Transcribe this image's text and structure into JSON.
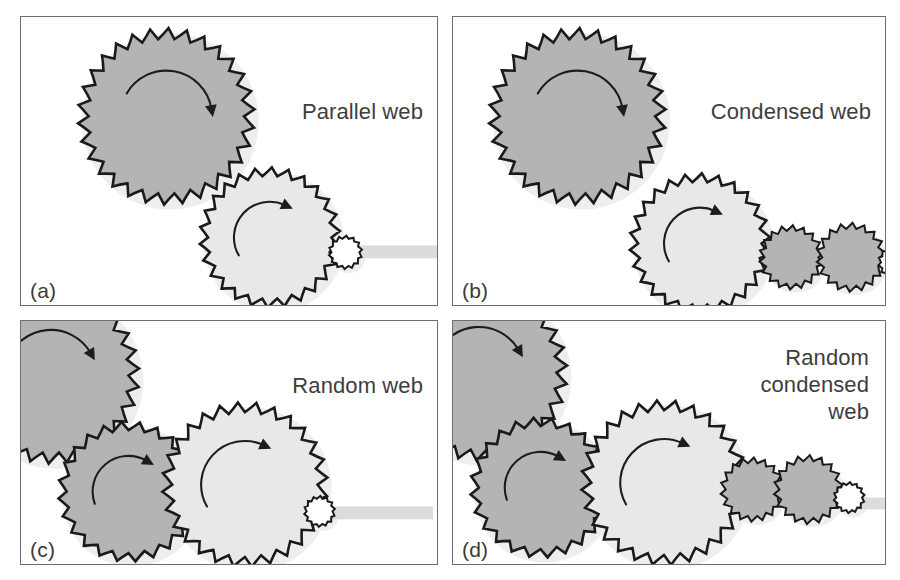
{
  "figure": {
    "type": "diagram",
    "background": "#ffffff"
  },
  "colors": {
    "panel_border": "#6e6e6e",
    "gear_dark_fill": "#b4b4b4",
    "gear_light_fill": "#e8e8e8",
    "gear_white_fill": "#ffffff",
    "gear_outline": "#1a1a1a",
    "glow": "#ededed",
    "shaft_bar": "#dcdcdc",
    "text": "#3d3d3d"
  },
  "panels": [
    {
      "id": "a",
      "label": "(a)",
      "caption": "Parallel web",
      "caption_lines": [
        "Parallel web"
      ],
      "x": 20,
      "y": 16,
      "w": 418,
      "h": 290,
      "gears": [
        {
          "name": "driver-gear",
          "cx": 146,
          "cy": 100,
          "r": 78,
          "teeth": 30,
          "fill": "dark",
          "arrow": "cw",
          "arrow_r": 46,
          "arrow_from": -150,
          "arrow_to": -10
        },
        {
          "name": "driven-gear",
          "cx": 250,
          "cy": 222,
          "r": 62,
          "teeth": 26,
          "fill": "light",
          "arrow": "cw",
          "arrow_r": 36,
          "arrow_from": 150,
          "arrow_to": 295
        },
        {
          "name": "output-pinion",
          "cx": 326,
          "cy": 237,
          "r": 14,
          "teeth": 14,
          "fill": "white",
          "arrow": "none"
        }
      ],
      "shaft_bar": {
        "x": 330,
        "y": 230,
        "w": 90,
        "h": 13
      }
    },
    {
      "id": "b",
      "label": "(b)",
      "caption": "Condensed web",
      "caption_lines": [
        "Condensed web"
      ],
      "x": 452,
      "y": 16,
      "w": 434,
      "h": 290,
      "gears": [
        {
          "name": "driver-gear",
          "cx": 125,
          "cy": 100,
          "r": 78,
          "teeth": 30,
          "fill": "dark",
          "arrow": "cw",
          "arrow_r": 46,
          "arrow_from": -150,
          "arrow_to": -10
        },
        {
          "name": "driven-gear",
          "cx": 248,
          "cy": 228,
          "r": 62,
          "teeth": 26,
          "fill": "light",
          "arrow": "cw",
          "arrow_r": 36,
          "arrow_from": 150,
          "arrow_to": 295
        },
        {
          "name": "idler-gear-1",
          "cx": 340,
          "cy": 242,
          "r": 27,
          "teeth": 18,
          "fill": "dark",
          "arrow": "none"
        },
        {
          "name": "idler-gear-2",
          "cx": 400,
          "cy": 242,
          "r": 29,
          "teeth": 18,
          "fill": "dark",
          "arrow": "none"
        },
        {
          "name": "output-pinion",
          "cx": 444,
          "cy": 247,
          "r": 14,
          "teeth": 14,
          "fill": "white",
          "arrow": "none"
        }
      ],
      "shaft_bar": {
        "x": 440,
        "y": 248,
        "w": 60,
        "h": 12
      }
    },
    {
      "id": "c",
      "label": "(c)",
      "caption": "Random web",
      "caption_lines": [
        "Random web"
      ],
      "x": 20,
      "y": 320,
      "w": 418,
      "h": 245,
      "gears": [
        {
          "name": "driver-gear",
          "cx": 30,
          "cy": 55,
          "r": 78,
          "teeth": 30,
          "fill": "dark",
          "arrow": "cw",
          "arrow_r": 46,
          "arrow_from": -160,
          "arrow_to": -30
        },
        {
          "name": "middle-gear",
          "cx": 108,
          "cy": 172,
          "r": 62,
          "teeth": 24,
          "fill": "dark",
          "arrow": "cw",
          "arrow_r": 36,
          "arrow_from": 160,
          "arrow_to": 300
        },
        {
          "name": "driven-gear",
          "cx": 225,
          "cy": 165,
          "r": 73,
          "teeth": 28,
          "fill": "light",
          "arrow": "cw",
          "arrow_r": 44,
          "arrow_from": 150,
          "arrow_to": 295
        },
        {
          "name": "output-pinion",
          "cx": 300,
          "cy": 192,
          "r": 13,
          "teeth": 14,
          "fill": "white",
          "arrow": "none"
        }
      ],
      "shaft_bar": {
        "x": 302,
        "y": 187,
        "w": 112,
        "h": 13
      }
    },
    {
      "id": "d",
      "label": "(d)",
      "caption": "Random condensed web",
      "caption_lines": [
        "Random",
        "condensed",
        "web"
      ],
      "x": 452,
      "y": 320,
      "w": 434,
      "h": 245,
      "gears": [
        {
          "name": "driver-gear",
          "cx": 26,
          "cy": 52,
          "r": 78,
          "teeth": 30,
          "fill": "dark",
          "arrow": "cw",
          "arrow_r": 46,
          "arrow_from": -160,
          "arrow_to": -30
        },
        {
          "name": "middle-gear",
          "cx": 88,
          "cy": 168,
          "r": 62,
          "teeth": 24,
          "fill": "dark",
          "arrow": "cw",
          "arrow_r": 36,
          "arrow_from": 160,
          "arrow_to": 300
        },
        {
          "name": "driven-gear",
          "cx": 212,
          "cy": 163,
          "r": 73,
          "teeth": 28,
          "fill": "light",
          "arrow": "cw",
          "arrow_r": 44,
          "arrow_from": 150,
          "arrow_to": 295
        },
        {
          "name": "idler-gear-1",
          "cx": 301,
          "cy": 170,
          "r": 27,
          "teeth": 18,
          "fill": "dark",
          "arrow": "none"
        },
        {
          "name": "idler-gear-2",
          "cx": 357,
          "cy": 170,
          "r": 29,
          "teeth": 18,
          "fill": "dark",
          "arrow": "none"
        },
        {
          "name": "output-pinion",
          "cx": 398,
          "cy": 178,
          "r": 13,
          "teeth": 14,
          "fill": "white",
          "arrow": "none"
        }
      ],
      "shaft_bar": {
        "x": 395,
        "y": 178,
        "w": 48,
        "h": 12
      }
    }
  ]
}
